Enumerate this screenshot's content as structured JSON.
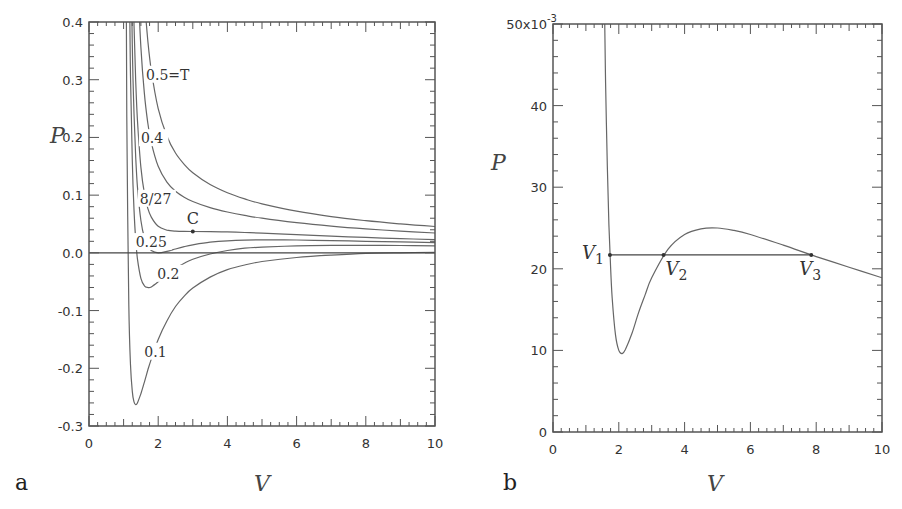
{
  "chart_data": [
    {
      "panel_label": "a",
      "type": "line",
      "title": "",
      "xlabel": "V",
      "ylabel": "P",
      "xlim": [
        0,
        10
      ],
      "ylim": [
        -0.3,
        0.4
      ],
      "xticks": [
        0,
        2,
        4,
        6,
        8,
        10
      ],
      "xtick_labels": [
        "0",
        "2",
        "4",
        "6",
        "8",
        "10"
      ],
      "yticks": [
        -0.3,
        -0.2,
        -0.1,
        0.0,
        0.1,
        0.2,
        0.3,
        0.4
      ],
      "ytick_labels": [
        "-0.3",
        "-0.2",
        "-0.1",
        "0.0",
        "0.1",
        "0.2",
        "0.3",
        "0.4"
      ],
      "grid": false,
      "hline": 0.0,
      "x": [
        1.05,
        1.08,
        1.1,
        1.15,
        1.2,
        1.25,
        1.3,
        1.35,
        1.4,
        1.5,
        1.6,
        1.7,
        1.8,
        2.0,
        2.25,
        2.5,
        2.75,
        3.0,
        3.5,
        4.0,
        4.5,
        5.0,
        6.0,
        7.0,
        8.0,
        9.0,
        10.0
      ],
      "series": [
        {
          "name": "0.1",
          "T": 0.1,
          "values": [
            1.09,
            0.393,
            0.174,
            -0.089,
            -0.194,
            -0.24,
            -0.258,
            -0.263,
            -0.26,
            -0.244,
            -0.224,
            -0.203,
            -0.184,
            -0.15,
            -0.118,
            -0.093,
            -0.075,
            -0.061,
            -0.042,
            -0.029,
            -0.021,
            -0.015,
            -0.008,
            -0.004,
            -0.001,
            0.0,
            0.001
          ]
        },
        {
          "name": "0.2",
          "T": 0.2,
          "values": [
            3.09,
            1.64,
            1.174,
            0.577,
            0.306,
            0.16,
            0.075,
            0.023,
            -0.01,
            -0.044,
            -0.057,
            -0.06,
            -0.059,
            -0.05,
            -0.0375,
            -0.027,
            -0.018,
            -0.011,
            -0.002,
            0.004,
            0.008,
            0.01,
            0.012,
            0.013,
            0.013,
            0.0127,
            0.012
          ]
        },
        {
          "name": "0.25",
          "T": 0.25,
          "values": [
            4.09,
            2.27,
            1.67,
            0.91,
            0.556,
            0.36,
            0.242,
            0.166,
            0.115,
            0.056,
            0.026,
            0.011,
            0.004,
            0.0,
            0.0025,
            0.0067,
            0.0107,
            0.0139,
            0.0184,
            0.0208,
            0.022,
            0.0225,
            0.0222,
            0.0213,
            0.0201,
            0.0189,
            0.0178
          ]
        },
        {
          "name": "8/27",
          "T": 0.2963,
          "values": [
            5.02,
            2.85,
            2.14,
            1.22,
            0.787,
            0.545,
            0.396,
            0.298,
            0.231,
            0.148,
            0.103,
            0.077,
            0.062,
            0.046,
            0.0395,
            0.0375,
            0.0371,
            0.037,
            0.0369,
            0.0363,
            0.0353,
            0.0341,
            0.0315,
            0.029,
            0.0267,
            0.0247,
            0.0229
          ]
        },
        {
          "name": "0.4",
          "T": 0.4,
          "values": [
            7.09,
            4.14,
            3.17,
            1.91,
            1.306,
            0.96,
            0.741,
            0.594,
            0.49,
            0.356,
            0.276,
            0.225,
            0.191,
            0.15,
            0.1225,
            0.1067,
            0.0964,
            0.0889,
            0.0784,
            0.0708,
            0.0649,
            0.06,
            0.0522,
            0.0463,
            0.0415,
            0.0377,
            0.0344
          ]
        },
        {
          "name": "0.5=T",
          "T": 0.5,
          "values": [
            9.09,
            5.39,
            4.17,
            2.58,
            1.806,
            1.36,
            1.075,
            0.88,
            0.74,
            0.556,
            0.443,
            0.368,
            0.316,
            0.25,
            0.2025,
            0.173,
            0.1535,
            0.1389,
            0.1184,
            0.1042,
            0.0935,
            0.085,
            0.0722,
            0.0629,
            0.0558,
            0.0502,
            0.0456
          ]
        }
      ],
      "annotations": [
        {
          "text": "0.5=T",
          "x": 1.65,
          "y": 0.3
        },
        {
          "text": "0.4",
          "x": 1.5,
          "y": 0.19
        },
        {
          "text": "8/27",
          "x": 1.47,
          "y": 0.085
        },
        {
          "text": "0.25",
          "x": 1.35,
          "y": 0.01
        },
        {
          "text": "0.2",
          "x": 1.97,
          "y": -0.045
        },
        {
          "text": "0.1",
          "x": 1.6,
          "y": -0.18
        }
      ],
      "critical_point": {
        "label": "C",
        "x": 3.0,
        "y": 0.037
      }
    },
    {
      "panel_label": "b",
      "type": "line",
      "title": "",
      "xlabel": "V",
      "ylabel": "P",
      "xlim": [
        0,
        10
      ],
      "ylim": [
        0,
        0.05
      ],
      "y_scale_label": "x10^-3",
      "xticks": [
        0,
        2,
        4,
        6,
        8,
        10
      ],
      "xtick_labels": [
        "0",
        "2",
        "4",
        "6",
        "8",
        "10"
      ],
      "yticks": [
        0,
        10,
        20,
        30,
        40,
        50
      ],
      "ytick_labels": [
        "0",
        "10",
        "20",
        "30",
        "40",
        "50x10"
      ],
      "ytick_exponent": "-3",
      "grid": false,
      "x": [
        1.57,
        1.6,
        1.65,
        1.7,
        1.75,
        1.8,
        1.9,
        2.0,
        2.1,
        2.2,
        2.4,
        2.6,
        2.8,
        3.0,
        3.5,
        4.0,
        4.5,
        5.0,
        5.5,
        6.0,
        7.0,
        8.0,
        9.0,
        10.0
      ],
      "series": [
        {
          "name": "T=0.26",
          "T": 0.26,
          "values": [
            50.4,
            42.7,
            32.7,
            25.4,
            20.2,
            16.4,
            11.9,
            10.0,
            9.6,
            10.1,
            12.1,
            14.6,
            16.8,
            18.9,
            22.4,
            24.2,
            24.9,
            25.0,
            24.7,
            24.2,
            22.9,
            21.5,
            20.2,
            18.9
          ]
        }
      ],
      "tie_line": {
        "y": 21.7,
        "x_start": 1.73,
        "x_end": 7.85
      },
      "points": [
        {
          "label": "V",
          "sub": "1",
          "x": 1.73,
          "y": 21.7
        },
        {
          "label": "V",
          "sub": "2",
          "x": 3.36,
          "y": 21.7
        },
        {
          "label": "V",
          "sub": "3",
          "x": 7.85,
          "y": 21.7
        }
      ]
    }
  ],
  "labels": {
    "panel_a": "a",
    "panel_b": "b",
    "a_xlabel": "V",
    "a_ylabel": "P",
    "b_xlabel": "V",
    "b_ylabel": "P",
    "b_top_tick": "50x10",
    "b_top_exp": "-3",
    "c_label": "C"
  }
}
